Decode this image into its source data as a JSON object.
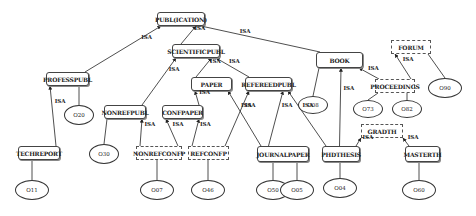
{
  "diagram": {
    "edge_label": "ISA",
    "classes": [
      {
        "id": "publication",
        "label": "PUBL(ICATION)",
        "style": "solid"
      },
      {
        "id": "scientificpubl",
        "label": "SCIENTIFICPUBL",
        "style": "solid"
      },
      {
        "id": "book",
        "label": "BOOK",
        "style": "solid"
      },
      {
        "id": "forum",
        "label": "FORUM",
        "style": "dashed"
      },
      {
        "id": "professpubl",
        "label": "PROFESSPUBL",
        "style": "solid"
      },
      {
        "id": "paper",
        "label": "PAPER",
        "style": "solid"
      },
      {
        "id": "refereedpubl",
        "label": "REFEREEDPUBL",
        "style": "solid"
      },
      {
        "id": "proceedings",
        "label": "PROCEEDINGS",
        "style": "dashed"
      },
      {
        "id": "nonrefpubl",
        "label": "NONREFPUBL",
        "style": "solid"
      },
      {
        "id": "confpaper",
        "label": "CONFPAPER",
        "style": "solid"
      },
      {
        "id": "gradth",
        "label": "GRADTH",
        "style": "dashed"
      },
      {
        "id": "techreport",
        "label": "TECHREPORT",
        "style": "solid"
      },
      {
        "id": "nonrefconfp",
        "label": "NONREFCONFP",
        "style": "dashed"
      },
      {
        "id": "refconfp",
        "label": "REFCONFP",
        "style": "dashed"
      },
      {
        "id": "journalpaper",
        "label": "JOURNALPAPER",
        "style": "solid"
      },
      {
        "id": "phdthesis",
        "label": "PHDTHESIS",
        "style": "solid"
      },
      {
        "id": "masterth",
        "label": "MASTERTH",
        "style": "solid"
      }
    ],
    "objects": [
      {
        "id": "o20",
        "label": "O20",
        "instance_of": "professpubl"
      },
      {
        "id": "o08",
        "label": "O08",
        "instance_of": "book"
      },
      {
        "id": "o90",
        "label": "O90",
        "instance_of": "forum"
      },
      {
        "id": "o73",
        "label": "O73",
        "instance_of": "proceedings"
      },
      {
        "id": "o82",
        "label": "O82",
        "instance_of": "proceedings"
      },
      {
        "id": "o30",
        "label": "O30",
        "instance_of": "nonrefpubl"
      },
      {
        "id": "o11",
        "label": "O11",
        "instance_of": "techreport"
      },
      {
        "id": "o07",
        "label": "O07",
        "instance_of": "nonrefconfp"
      },
      {
        "id": "o46",
        "label": "O46",
        "instance_of": "refconfp"
      },
      {
        "id": "o50",
        "label": "O50",
        "instance_of": "journalpaper"
      },
      {
        "id": "o05",
        "label": "O05",
        "instance_of": "journalpaper"
      },
      {
        "id": "o04",
        "label": "O04",
        "instance_of": "phdthesis"
      },
      {
        "id": "o60",
        "label": "O60",
        "instance_of": "masterth"
      }
    ],
    "isa_edges": [
      {
        "from": "professpubl",
        "to": "publication"
      },
      {
        "from": "scientificpubl",
        "to": "publication"
      },
      {
        "from": "book",
        "to": "publication"
      },
      {
        "from": "nonrefpubl",
        "to": "scientificpubl"
      },
      {
        "from": "paper",
        "to": "scientificpubl"
      },
      {
        "from": "refereedpubl",
        "to": "scientificpubl"
      },
      {
        "from": "proceedings",
        "to": "book"
      },
      {
        "from": "proceedings",
        "to": "forum"
      },
      {
        "from": "techreport",
        "to": "professpubl"
      },
      {
        "from": "confpaper",
        "to": "paper"
      },
      {
        "from": "journalpaper",
        "to": "paper"
      },
      {
        "from": "nonrefconfp",
        "to": "nonrefpubl"
      },
      {
        "from": "nonrefconfp",
        "to": "confpaper"
      },
      {
        "from": "refconfp",
        "to": "confpaper"
      },
      {
        "from": "refconfp",
        "to": "refereedpubl"
      },
      {
        "from": "journalpaper",
        "to": "refereedpubl"
      },
      {
        "from": "phdthesis",
        "to": "refereedpubl"
      },
      {
        "from": "phdthesis",
        "to": "book"
      },
      {
        "from": "phdthesis",
        "to": "gradth"
      },
      {
        "from": "masterth",
        "to": "gradth"
      }
    ]
  }
}
